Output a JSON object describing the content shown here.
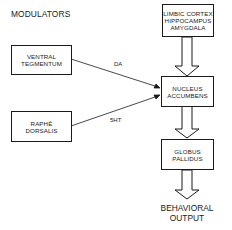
{
  "diagram": {
    "title": "MODULATORS",
    "nodes": {
      "limbic": {
        "label": "LIMBIC  CORTEX\nHIPPOCAMPUS\nAMYGDALA"
      },
      "nucleus": {
        "label": "NUCLEUS\nACCUMBENS"
      },
      "globus": {
        "label": "GLOBUS\nPALLIDUS"
      },
      "ventral": {
        "label": "VENTRAL\nTEGMENTUM"
      },
      "raphe": {
        "label": "RAPHÉ\nDORSALIS"
      }
    },
    "edges": [
      {
        "from": "limbic",
        "to": "nucleus",
        "style": "hollow-arrow"
      },
      {
        "from": "ventral",
        "to": "nucleus",
        "label": "DA",
        "style": "line-arrow"
      },
      {
        "from": "raphe",
        "to": "nucleus",
        "label": "5HT",
        "style": "line-arrow"
      },
      {
        "from": "nucleus",
        "to": "globus",
        "style": "hollow-arrow"
      },
      {
        "from": "globus",
        "to": "output",
        "style": "hollow-arrow"
      }
    ],
    "edge_labels": {
      "da": "DA",
      "ht": "5HT"
    },
    "output": "BEHAVIORAL\nOUTPUT"
  }
}
